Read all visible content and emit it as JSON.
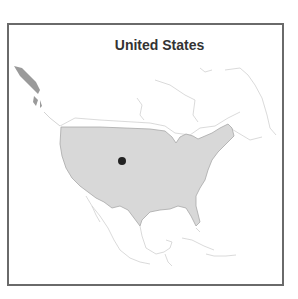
{
  "map": {
    "title": "United States",
    "region_highlighted": "United States (contiguous)",
    "marker": {
      "type": "dot",
      "location": "central United States",
      "color": "#222222"
    },
    "colors": {
      "highlighted_fill": "#d8d8d8",
      "highlighted_stroke": "#a8a8a8",
      "other_land_stroke": "#cfcfcf",
      "alaska_fill": "#9a9a9a",
      "frame": "#6a6a6a",
      "title": "#333333"
    }
  }
}
